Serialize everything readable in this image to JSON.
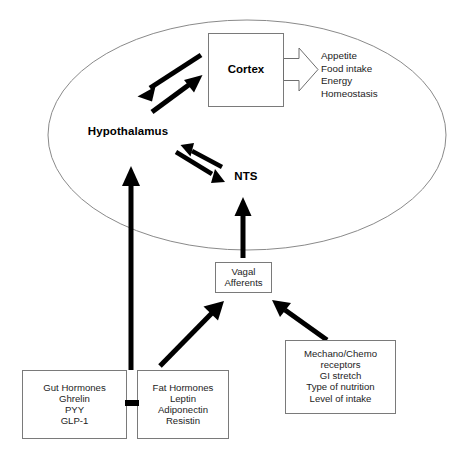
{
  "figure": {
    "type": "flow-diagram",
    "background_color": "#ffffff",
    "line_color": "#000000",
    "outline_color": "#8a8a8a"
  },
  "brain": {
    "region_hypothalamus": "Hypothalamus",
    "region_nts": "NTS",
    "cortex_label": "Cortex"
  },
  "outputs": {
    "line1": "Appetite",
    "line2": "Food intake",
    "line3": "Energy",
    "line4": "Homeostasis"
  },
  "vagal": {
    "line1": "Vagal",
    "line2": "Afferents"
  },
  "gut_hormones": {
    "line1": "Gut Hormones",
    "line2": "Ghrelin",
    "line3": "PYY",
    "line4": "GLP-1"
  },
  "fat_hormones": {
    "line1": "Fat Hormones",
    "line2": "Leptin",
    "line3": "Adiponectin",
    "line4": "Resistin"
  },
  "mechano_chemo": {
    "line1": "Mechano/Chemo",
    "line2": "receptors",
    "line3": "GI stretch",
    "line4": "Type of nutrition",
    "line5": "Level of intake"
  }
}
